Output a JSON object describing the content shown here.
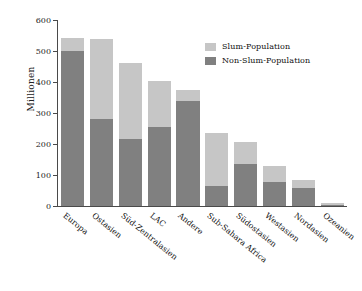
{
  "chart_data": {
    "type": "bar",
    "title": "",
    "subtitle": "",
    "xlabel": "",
    "ylabel": "Millionen",
    "ylim": [
      0,
      600
    ],
    "yticks": [
      0,
      100,
      200,
      300,
      400,
      500,
      600
    ],
    "ytick_labels": [
      "0",
      "100",
      "200",
      "300",
      "400",
      "500",
      "600"
    ],
    "grid": false,
    "stacked": true,
    "legend_position": "top-right",
    "categories": [
      "Europa",
      "Ostasien",
      "Süd-Zentralasien",
      "LAC",
      "Andere",
      "Sub-Sahara Africa",
      "Südostasien",
      "Westasien",
      "Nordasien",
      "Ozeanien"
    ],
    "series": [
      {
        "name": "Non-Slum-Population",
        "color": "#808080",
        "values": [
          500,
          281,
          217,
          256,
          340,
          65,
          134,
          78,
          58,
          4
        ]
      },
      {
        "name": "Slum-Population",
        "color": "#c6c6c6",
        "values": [
          41,
          259,
          245,
          148,
          35,
          170,
          73,
          52,
          27,
          6
        ]
      }
    ],
    "totals": [
      541,
      540,
      462,
      404,
      375,
      235,
      207,
      130,
      85,
      10
    ]
  },
  "legend": {
    "items": [
      {
        "label": "Slum-Population",
        "color": "#c6c6c6"
      },
      {
        "label": "Non-Slum-Population",
        "color": "#808080"
      }
    ]
  },
  "colors": {
    "slum": "#c6c6c6",
    "non_slum": "#808080",
    "axis": "#4a4a4a",
    "text": "#111111",
    "background": "#ffffff"
  }
}
